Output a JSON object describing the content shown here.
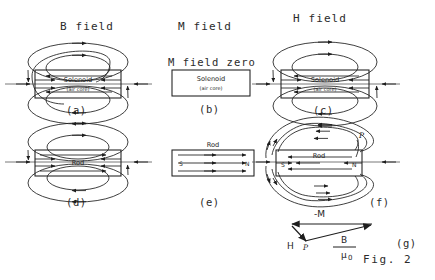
{
  "figure": {
    "caption": "Fig. 2",
    "column_headers": [
      {
        "id": "b-field",
        "label": "B field"
      },
      {
        "id": "m-field",
        "label": "M field"
      },
      {
        "id": "h-field",
        "label": "H field"
      }
    ],
    "notes": [
      {
        "id": "m-field-zero",
        "text": "M field zero"
      }
    ],
    "panels": [
      {
        "id": "a",
        "label": "(a)",
        "field": "B field",
        "object": "Solenoid",
        "object_sub": "(air core)"
      },
      {
        "id": "b",
        "label": "(b)",
        "field": "M field",
        "object": "Solenoid",
        "object_sub": "(air core)"
      },
      {
        "id": "c",
        "label": "(c)",
        "field": "H field",
        "object": "Solenoid",
        "object_sub": "(air core)"
      },
      {
        "id": "d",
        "label": "(d)",
        "field": "B field",
        "object": "Rod",
        "object_sub": ""
      },
      {
        "id": "e",
        "label": "(e)",
        "field": "M field",
        "object": "Rod",
        "object_sub": ""
      },
      {
        "id": "f",
        "label": "(f)",
        "field": "H field",
        "object": "Rod",
        "object_sub": ""
      },
      {
        "id": "g",
        "label": "(g)",
        "field": "vector relation",
        "object": "",
        "object_sub": ""
      }
    ],
    "object_labels": {
      "solenoid": "Solenoid",
      "solenoid_sub": "(air core)",
      "rod": "Rod"
    },
    "pole_labels": {
      "south": "S",
      "north": "N"
    },
    "point_label": "P",
    "vector_diagram": {
      "vectors": [
        {
          "id": "minus-m",
          "label": "-M"
        },
        {
          "id": "h",
          "label": "H"
        },
        {
          "id": "b-over-mu0",
          "numerator": "B",
          "denominator": "μ",
          "denominator_sub": "0"
        }
      ],
      "point_label": "P"
    },
    "colors": {
      "ink": "#1e1e1e",
      "axis": "#555555",
      "background": "#ffffff"
    }
  }
}
